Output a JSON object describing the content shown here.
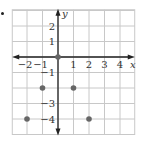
{
  "marker": "•",
  "chart_data": {
    "type": "scatter",
    "title": "",
    "xlabel": "x",
    "ylabel": "y",
    "xlim": [
      -3,
      5
    ],
    "ylim": [
      -5,
      3
    ],
    "grid": true,
    "x_tick_labels": [
      "-2",
      "-1",
      "1",
      "2",
      "3",
      "4"
    ],
    "y_tick_labels": [
      "2",
      "1",
      "-1",
      "-3",
      "-4"
    ],
    "points": [
      {
        "x": 0,
        "y": 0
      },
      {
        "x": -1,
        "y": -2
      },
      {
        "x": 1,
        "y": -2
      },
      {
        "x": -2,
        "y": -4
      },
      {
        "x": 2,
        "y": -4
      }
    ],
    "colors": {
      "grid": "#c8c8c8",
      "axis": "#222222",
      "point": "#666666",
      "text": "#333333"
    }
  }
}
